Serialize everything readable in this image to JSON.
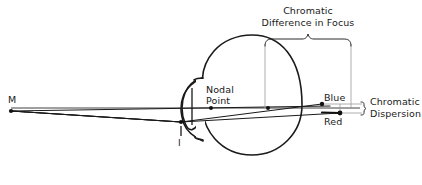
{
  "figure": {
    "type": "optical-ray-diagram",
    "background_color": "#ffffff",
    "line_color": "#1a1a1a",
    "leader_line_color": "#9a9a9a"
  },
  "labels": {
    "object_point": "M",
    "image_point": "I",
    "nodal_point_line1": "Nodal",
    "nodal_point_line2": "Point",
    "blue_focus": "Blue",
    "red_focus": "Red",
    "difference_in_focus_line1": "Chromatic",
    "difference_in_focus_line2": "Difference in Focus",
    "dispersion_line1": "Chromatic",
    "dispersion_line2": "Dispersion"
  },
  "geometry": {
    "object_point": {
      "x": 11,
      "y": 111
    },
    "image_point": {
      "x": 181,
      "y": 122
    },
    "nodal_point": {
      "x": 211,
      "y": 108
    },
    "retina_reference_point": {
      "x": 268,
      "y": 108
    },
    "blue_focus_point": {
      "x": 322,
      "y": 104
    },
    "red_focus_point": {
      "x": 340,
      "y": 113
    },
    "eye_center": {
      "x": 252,
      "y": 105
    },
    "eye_radius": 50,
    "optical_axis_y": 108,
    "focus_brace": {
      "x_start": 265,
      "x_end": 351,
      "y": 41
    },
    "dispersion_brace": {
      "x": 363,
      "y_top": 104,
      "y_bottom": 113
    }
  }
}
